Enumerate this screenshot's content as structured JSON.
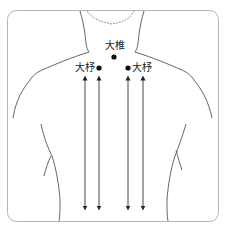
{
  "figure": {
    "points": [
      {
        "name": "大椎",
        "position": "center-top"
      },
      {
        "name": "大杼",
        "position": "left"
      },
      {
        "name": "大杼",
        "position": "right"
      }
    ],
    "arrows": {
      "count": 4,
      "direction": "bidirectional-vertical"
    },
    "colors": {
      "line": "#555555",
      "dot": "#111111",
      "frame": "#b0b0b0"
    }
  }
}
